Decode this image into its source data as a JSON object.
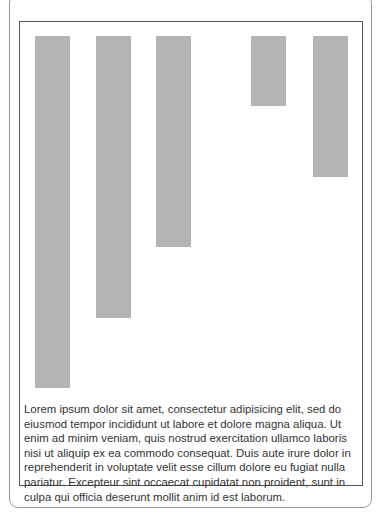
{
  "chart_data": {
    "type": "bar",
    "title": "",
    "xlabel": "",
    "ylabel": "",
    "categories": [
      "1",
      "2",
      "3",
      "4",
      "5"
    ],
    "values": [
      5,
      4,
      3,
      1,
      2
    ],
    "orientation": "vertical, bars hang from top",
    "grid": false,
    "legend": null,
    "bar_color": "#b3b3b3",
    "layout": {
      "bar_top": 36,
      "unit_px": 70.4,
      "bar_width": 35,
      "bar_x": [
        35,
        96,
        156,
        251,
        313
      ]
    }
  },
  "caption": {
    "text": "Lorem ipsum dolor sit amet, consectetur adipisicing elit, sed do eiusmod tempor incididunt ut labore et dolore magna aliqua. Ut enim ad minim veniam, quis nostrud exercitation ullamco laboris nisi ut aliquip ex ea commodo consequat. Duis aute irure dolor in reprehenderit in voluptate velit esse cillum dolore eu fugiat nulla pariatur. Excepteur sint occaecat cupidatat non proident, sunt in culpa qui officia deserunt mollit anim id est laborum."
  }
}
